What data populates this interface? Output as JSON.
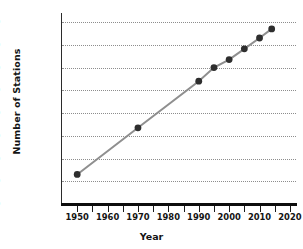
{
  "chart_data": {
    "type": "line",
    "title": "",
    "xlabel": "Year",
    "ylabel": "Number of Stations",
    "xlim": [
      1945,
      2022
    ],
    "ylim": [
      0,
      16800
    ],
    "grid": true,
    "legend": "none",
    "marker": "filled-circle",
    "line_color": "#8f8f8f",
    "marker_color": "#2e2e2e",
    "grid_color": "#8d8d8d",
    "axis_color": "#0d0d0d",
    "x": [
      1950,
      1970,
      1990,
      1995,
      2000,
      2005,
      2010,
      2014
    ],
    "values": [
      2600,
      6700,
      10800,
      12000,
      12700,
      13650,
      14600,
      15400
    ],
    "points": [
      {
        "year": 1950,
        "stations": 2600
      },
      {
        "year": 1970,
        "stations": 6700
      },
      {
        "year": 1990,
        "stations": 10800
      },
      {
        "year": 1995,
        "stations": 12000
      },
      {
        "year": 2000,
        "stations": 12700
      },
      {
        "year": 2005,
        "stations": 13650
      },
      {
        "year": 2010,
        "stations": 14600
      },
      {
        "year": 2014,
        "stations": 15400
      }
    ],
    "yticks": [
      0,
      2000,
      4000,
      6000,
      8000,
      10000,
      12000,
      14000,
      16000
    ],
    "ytick_labels": [
      "0",
      "2000",
      "4000",
      "6000",
      "8000",
      "10,000",
      "12,000",
      "14,000",
      "16,000"
    ],
    "xticks": [
      1950,
      1955,
      1960,
      1965,
      1970,
      1975,
      1980,
      1985,
      1990,
      1995,
      2000,
      2005,
      2010,
      2015,
      2020
    ],
    "xtick_labels": [
      {
        "value": 1950,
        "label": "1950"
      },
      {
        "value": 1955,
        "label": ""
      },
      {
        "value": 1960,
        "label": "1960"
      },
      {
        "value": 1965,
        "label": ""
      },
      {
        "value": 1970,
        "label": "1970"
      },
      {
        "value": 1975,
        "label": ""
      },
      {
        "value": 1980,
        "label": "1980"
      },
      {
        "value": 1985,
        "label": ""
      },
      {
        "value": 1990,
        "label": "1990"
      },
      {
        "value": 1995,
        "label": ""
      },
      {
        "value": 2000,
        "label": "2000"
      },
      {
        "value": 2005,
        "label": ""
      },
      {
        "value": 2010,
        "label": "2010"
      },
      {
        "value": 2015,
        "label": ""
      },
      {
        "value": 2020,
        "label": "2020"
      }
    ]
  }
}
